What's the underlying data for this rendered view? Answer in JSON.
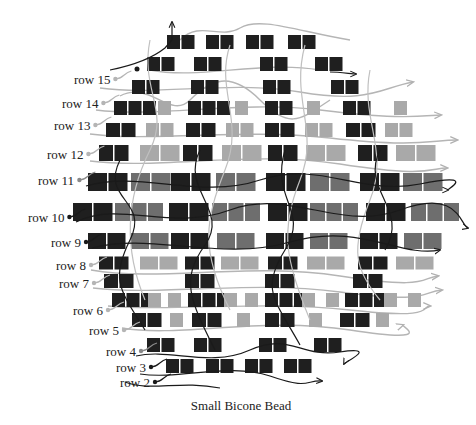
{
  "caption": "Small Bicone Bead",
  "colors": {
    "dark_bead": "#1f1f1f",
    "mid_bead": "#6e6e6e",
    "light_bead": "#a9a9a9",
    "dark_thread": "#1a1a1a",
    "light_thread": "#b5b5b5",
    "label_text": "#222222",
    "background": "#ffffff"
  },
  "row_labels": [
    {
      "text": "row 15",
      "x": 74,
      "y": 82,
      "dot_color": "#b5b5b5"
    },
    {
      "text": "row 14",
      "x": 62,
      "y": 106,
      "dot_color": "#b5b5b5"
    },
    {
      "text": "row 13",
      "x": 54,
      "y": 128,
      "dot_color": "#b5b5b5"
    },
    {
      "text": "row 12",
      "x": 47,
      "y": 157,
      "dot_color": "#b5b5b5"
    },
    {
      "text": "row 11",
      "x": 38,
      "y": 183,
      "dot_color": "#8a8a8a"
    },
    {
      "text": "row 10",
      "x": 28,
      "y": 220,
      "dot_color": "#1a1a1a"
    },
    {
      "text": "row 9",
      "x": 51,
      "y": 245,
      "dot_color": "#1a1a1a"
    },
    {
      "text": "row 8",
      "x": 56,
      "y": 268,
      "dot_color": "#b5b5b5"
    },
    {
      "text": "row 7",
      "x": 59,
      "y": 286,
      "dot_color": "#b5b5b5"
    },
    {
      "text": "row 6",
      "x": 73,
      "y": 313,
      "dot_color": "#b5b5b5"
    },
    {
      "text": "row 5",
      "x": 89,
      "y": 333,
      "dot_color": "#b5b5b5"
    },
    {
      "text": "row 4",
      "x": 106,
      "y": 354,
      "dot_color": "#8a8a8a"
    },
    {
      "text": "row 3",
      "x": 116,
      "y": 370,
      "dot_color": "#1a1a1a"
    },
    {
      "text": "row 2",
      "x": 120,
      "y": 385,
      "dot_color": "#1a1a1a"
    }
  ],
  "bead_rows": [
    {
      "name": "top",
      "y": 42,
      "h": 14,
      "groups": [
        {
          "x": 167,
          "n": 2,
          "w": 13,
          "c": "dark"
        },
        {
          "x": 206,
          "n": 2,
          "w": 13,
          "c": "dark"
        },
        {
          "x": 246,
          "n": 2,
          "w": 13,
          "c": "dark"
        },
        {
          "x": 288,
          "n": 2,
          "w": 13,
          "c": "dark"
        }
      ]
    },
    {
      "name": "row16",
      "y": 64,
      "h": 14,
      "groups": [
        {
          "x": 147,
          "n": 2,
          "w": 13,
          "c": "dark"
        },
        {
          "x": 194,
          "n": 2,
          "w": 13,
          "c": "dark"
        },
        {
          "x": 260,
          "n": 2,
          "w": 13,
          "c": "dark"
        },
        {
          "x": 315,
          "n": 2,
          "w": 13,
          "c": "dark"
        }
      ]
    },
    {
      "name": "row15",
      "y": 87,
      "h": 14,
      "groups": [
        {
          "x": 132,
          "n": 2,
          "w": 13,
          "c": "dark"
        },
        {
          "x": 191,
          "n": 2,
          "w": 13,
          "c": "dark"
        },
        {
          "x": 263,
          "n": 2,
          "w": 13,
          "c": "dark"
        },
        {
          "x": 331,
          "n": 2,
          "w": 13,
          "c": "dark"
        }
      ]
    },
    {
      "name": "row14",
      "y": 108,
      "h": 14,
      "groups": [
        {
          "x": 114,
          "n": 3,
          "w": 13,
          "c": "dark"
        },
        {
          "x": 158,
          "n": 1,
          "w": 13,
          "c": "light"
        },
        {
          "x": 188,
          "n": 3,
          "w": 13,
          "c": "dark"
        },
        {
          "x": 235,
          "n": 1,
          "w": 13,
          "c": "light"
        },
        {
          "x": 265,
          "n": 2,
          "w": 13,
          "c": "dark"
        },
        {
          "x": 307,
          "n": 1,
          "w": 13,
          "c": "light"
        },
        {
          "x": 343,
          "n": 2,
          "w": 13,
          "c": "dark"
        },
        {
          "x": 394,
          "n": 1,
          "w": 13,
          "c": "light"
        }
      ]
    },
    {
      "name": "row13",
      "y": 130,
      "h": 14,
      "groups": [
        {
          "x": 106,
          "n": 2,
          "w": 14,
          "c": "dark"
        },
        {
          "x": 146,
          "n": 2,
          "w": 13,
          "c": "light"
        },
        {
          "x": 186,
          "n": 2,
          "w": 14,
          "c": "dark"
        },
        {
          "x": 226,
          "n": 2,
          "w": 13,
          "c": "light"
        },
        {
          "x": 265,
          "n": 2,
          "w": 14,
          "c": "dark"
        },
        {
          "x": 305,
          "n": 2,
          "w": 13,
          "c": "light"
        },
        {
          "x": 346,
          "n": 2,
          "w": 14,
          "c": "dark"
        },
        {
          "x": 385,
          "n": 2,
          "w": 13,
          "c": "light"
        }
      ]
    },
    {
      "name": "row12",
      "y": 153,
      "h": 16,
      "groups": [
        {
          "x": 99,
          "n": 2,
          "w": 14,
          "c": "dark"
        },
        {
          "x": 140,
          "n": 2,
          "w": 19,
          "c": "light"
        },
        {
          "x": 183,
          "n": 2,
          "w": 14,
          "c": "dark"
        },
        {
          "x": 222,
          "n": 2,
          "w": 19,
          "c": "light"
        },
        {
          "x": 268,
          "n": 2,
          "w": 14,
          "c": "dark"
        },
        {
          "x": 306,
          "n": 2,
          "w": 19,
          "c": "light"
        },
        {
          "x": 358,
          "n": 2,
          "w": 14,
          "c": "dark"
        },
        {
          "x": 396,
          "n": 2,
          "w": 19,
          "c": "light"
        }
      ]
    },
    {
      "name": "row11",
      "y": 182,
      "h": 18,
      "groups": [
        {
          "x": 88,
          "n": 2,
          "w": 19,
          "c": "dark"
        },
        {
          "x": 131,
          "n": 2,
          "w": 19,
          "c": "mid"
        },
        {
          "x": 171,
          "n": 2,
          "w": 19,
          "c": "dark"
        },
        {
          "x": 216,
          "n": 2,
          "w": 19,
          "c": "mid"
        },
        {
          "x": 266,
          "n": 2,
          "w": 19,
          "c": "dark"
        },
        {
          "x": 310,
          "n": 2,
          "w": 19,
          "c": "mid"
        },
        {
          "x": 360,
          "n": 2,
          "w": 19,
          "c": "dark"
        },
        {
          "x": 403,
          "n": 2,
          "w": 19,
          "c": "mid"
        }
      ]
    },
    {
      "name": "row10",
      "y": 212,
      "h": 18,
      "groups": [
        {
          "x": 73,
          "n": 2,
          "w": 19,
          "c": "dark"
        },
        {
          "x": 115,
          "n": 3,
          "w": 15,
          "c": "mid"
        },
        {
          "x": 169,
          "n": 2,
          "w": 19,
          "c": "dark"
        },
        {
          "x": 212,
          "n": 3,
          "w": 15,
          "c": "mid"
        },
        {
          "x": 268,
          "n": 2,
          "w": 19,
          "c": "dark"
        },
        {
          "x": 310,
          "n": 3,
          "w": 15,
          "c": "mid"
        },
        {
          "x": 366,
          "n": 2,
          "w": 19,
          "c": "dark"
        },
        {
          "x": 411,
          "n": 3,
          "w": 15,
          "c": "mid"
        }
      ]
    },
    {
      "name": "row9",
      "y": 241,
      "h": 16,
      "groups": [
        {
          "x": 88,
          "n": 2,
          "w": 18,
          "c": "dark"
        },
        {
          "x": 131,
          "n": 2,
          "w": 18,
          "c": "mid"
        },
        {
          "x": 171,
          "n": 2,
          "w": 18,
          "c": "dark"
        },
        {
          "x": 217,
          "n": 2,
          "w": 18,
          "c": "mid"
        },
        {
          "x": 266,
          "n": 2,
          "w": 18,
          "c": "dark"
        },
        {
          "x": 310,
          "n": 2,
          "w": 18,
          "c": "mid"
        },
        {
          "x": 360,
          "n": 2,
          "w": 18,
          "c": "dark"
        },
        {
          "x": 404,
          "n": 2,
          "w": 18,
          "c": "mid"
        }
      ]
    },
    {
      "name": "row8",
      "y": 263,
      "h": 13,
      "groups": [
        {
          "x": 99,
          "n": 2,
          "w": 14,
          "c": "dark"
        },
        {
          "x": 140,
          "n": 2,
          "w": 18,
          "c": "light"
        },
        {
          "x": 185,
          "n": 2,
          "w": 14,
          "c": "dark"
        },
        {
          "x": 221,
          "n": 2,
          "w": 18,
          "c": "light"
        },
        {
          "x": 268,
          "n": 2,
          "w": 14,
          "c": "dark"
        },
        {
          "x": 307,
          "n": 2,
          "w": 18,
          "c": "light"
        },
        {
          "x": 358,
          "n": 2,
          "w": 14,
          "c": "dark"
        },
        {
          "x": 396,
          "n": 2,
          "w": 18,
          "c": "light"
        }
      ]
    },
    {
      "name": "row7",
      "y": 281,
      "h": 14,
      "groups": [
        {
          "x": 104,
          "n": 2,
          "w": 14,
          "c": "dark"
        },
        {
          "x": 185,
          "n": 2,
          "w": 14,
          "c": "dark"
        },
        {
          "x": 265,
          "n": 2,
          "w": 14,
          "c": "dark"
        },
        {
          "x": 353,
          "n": 2,
          "w": 14,
          "c": "dark"
        }
      ]
    },
    {
      "name": "row6",
      "y": 300,
      "h": 14,
      "groups": [
        {
          "x": 112,
          "n": 3,
          "w": 13,
          "c": "dark"
        },
        {
          "x": 148,
          "n": 1,
          "w": 13,
          "c": "light"
        },
        {
          "x": 168,
          "n": 1,
          "w": 13,
          "c": "light"
        },
        {
          "x": 188,
          "n": 3,
          "w": 13,
          "c": "dark"
        },
        {
          "x": 224,
          "n": 1,
          "w": 13,
          "c": "light"
        },
        {
          "x": 245,
          "n": 1,
          "w": 13,
          "c": "light"
        },
        {
          "x": 265,
          "n": 3,
          "w": 13,
          "c": "dark"
        },
        {
          "x": 302,
          "n": 1,
          "w": 13,
          "c": "light"
        },
        {
          "x": 326,
          "n": 1,
          "w": 13,
          "c": "light"
        },
        {
          "x": 345,
          "n": 3,
          "w": 13,
          "c": "dark"
        },
        {
          "x": 384,
          "n": 1,
          "w": 13,
          "c": "light"
        },
        {
          "x": 408,
          "n": 1,
          "w": 13,
          "c": "light"
        }
      ]
    },
    {
      "name": "row5",
      "y": 320,
      "h": 14,
      "groups": [
        {
          "x": 132,
          "n": 2,
          "w": 14,
          "c": "dark"
        },
        {
          "x": 170,
          "n": 1,
          "w": 13,
          "c": "light"
        },
        {
          "x": 192,
          "n": 2,
          "w": 14,
          "c": "dark"
        },
        {
          "x": 237,
          "n": 1,
          "w": 13,
          "c": "light"
        },
        {
          "x": 265,
          "n": 2,
          "w": 14,
          "c": "dark"
        },
        {
          "x": 309,
          "n": 1,
          "w": 13,
          "c": "light"
        },
        {
          "x": 340,
          "n": 2,
          "w": 14,
          "c": "dark"
        },
        {
          "x": 376,
          "n": 1,
          "w": 13,
          "c": "light"
        }
      ]
    },
    {
      "name": "row4",
      "y": 345,
      "h": 14,
      "groups": [
        {
          "x": 147,
          "n": 2,
          "w": 13,
          "c": "dark"
        },
        {
          "x": 194,
          "n": 2,
          "w": 13,
          "c": "dark"
        },
        {
          "x": 259,
          "n": 2,
          "w": 13,
          "c": "dark"
        },
        {
          "x": 314,
          "n": 2,
          "w": 13,
          "c": "dark"
        }
      ]
    },
    {
      "name": "row3",
      "y": 366,
      "h": 14,
      "groups": [
        {
          "x": 166,
          "n": 2,
          "w": 13,
          "c": "dark"
        },
        {
          "x": 206,
          "n": 2,
          "w": 13,
          "c": "dark"
        },
        {
          "x": 245,
          "n": 2,
          "w": 13,
          "c": "dark"
        },
        {
          "x": 284,
          "n": 2,
          "w": 13,
          "c": "dark"
        }
      ]
    }
  ],
  "thread_ends": [
    {
      "x1": 172,
      "y1": 42,
      "x2": 172,
      "y2": 22,
      "color": "#1a1a1a"
    },
    {
      "x1": 298,
      "y1": 375,
      "x2": 322,
      "y2": 383,
      "color": "#1a1a1a"
    },
    {
      "x1": 102,
      "y1": 226,
      "x2": 470,
      "y2": 228,
      "color": "#1a1a1a"
    }
  ]
}
